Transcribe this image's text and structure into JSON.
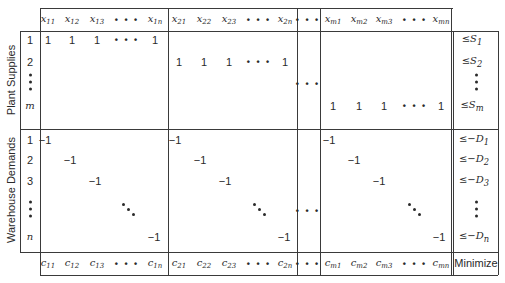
{
  "side_labels": {
    "supplies": "Plant Supplies",
    "demands": "Warehouse Demands"
  },
  "header": {
    "group1": [
      {
        "b": "x",
        "s": "11",
        "x": 48
      },
      {
        "b": "x",
        "s": "12",
        "x": 72
      },
      {
        "b": "x",
        "s": "13",
        "x": 97
      },
      {
        "dots": true,
        "x": 127
      },
      {
        "b": "x",
        "s": "1n",
        "x": 155
      }
    ],
    "group2": [
      {
        "b": "x",
        "s": "21",
        "x": 179
      },
      {
        "b": "x",
        "s": "22",
        "x": 204
      },
      {
        "b": "x",
        "s": "23",
        "x": 229
      },
      {
        "dots": true,
        "x": 259
      },
      {
        "b": "x",
        "s": "2n",
        "x": 285
      }
    ],
    "middle_dots": true,
    "group3": [
      {
        "b": "x",
        "s": "m1",
        "x": 333
      },
      {
        "b": "x",
        "s": "m2",
        "x": 359
      },
      {
        "b": "x",
        "s": "m3",
        "x": 384
      },
      {
        "dots": true,
        "x": 415
      },
      {
        "b": "x",
        "s": "mn",
        "x": 441
      }
    ]
  },
  "row_labels": {
    "supply": [
      "1",
      "2",
      "⋮",
      "m"
    ],
    "demand": [
      "1",
      "2",
      "3",
      "⋮",
      "n"
    ]
  },
  "supply_rows": [
    {
      "label": "1",
      "group": 1,
      "values": [
        "1",
        "1",
        "1",
        "•••",
        "1"
      ]
    },
    {
      "label": "2",
      "group": 2,
      "values": [
        "1",
        "1",
        "1",
        "•••",
        "1"
      ]
    },
    {
      "label": "m",
      "group": 3,
      "values": [
        "1",
        "1",
        "1",
        "•••",
        "1"
      ]
    }
  ],
  "demand_diag_value": "−1",
  "rhs": {
    "supply": [
      {
        "prefix": "≤",
        "b": "S",
        "s": "1"
      },
      {
        "prefix": "≤",
        "b": "S",
        "s": "2"
      },
      {
        "dots": true
      },
      {
        "prefix": "≤",
        "b": "S",
        "s": "m"
      }
    ],
    "demand": [
      {
        "prefix": "≤−",
        "b": "D",
        "s": "1"
      },
      {
        "prefix": "≤−",
        "b": "D",
        "s": "2"
      },
      {
        "prefix": "≤−",
        "b": "D",
        "s": "3"
      },
      {
        "dots": true
      },
      {
        "prefix": "≤−",
        "b": "D",
        "s": "n"
      }
    ]
  },
  "costs": {
    "group1": [
      {
        "b": "c",
        "s": "11",
        "x": 48
      },
      {
        "b": "c",
        "s": "12",
        "x": 72
      },
      {
        "b": "c",
        "s": "13",
        "x": 97
      },
      {
        "dots": true,
        "x": 127
      },
      {
        "b": "c",
        "s": "1n",
        "x": 155
      }
    ],
    "group2": [
      {
        "b": "c",
        "s": "21",
        "x": 179
      },
      {
        "b": "c",
        "s": "22",
        "x": 204
      },
      {
        "b": "c",
        "s": "23",
        "x": 229
      },
      {
        "dots": true,
        "x": 259
      },
      {
        "b": "c",
        "s": "2n",
        "x": 285
      }
    ],
    "group3": [
      {
        "b": "c",
        "s": "m1",
        "x": 333
      },
      {
        "b": "c",
        "s": "m2",
        "x": 359
      },
      {
        "b": "c",
        "s": "m3",
        "x": 384
      },
      {
        "dots": true,
        "x": 415
      },
      {
        "b": "c",
        "s": "mn",
        "x": 441
      }
    ],
    "objective_label": "Minimize"
  },
  "dots_glyph": "• • •"
}
